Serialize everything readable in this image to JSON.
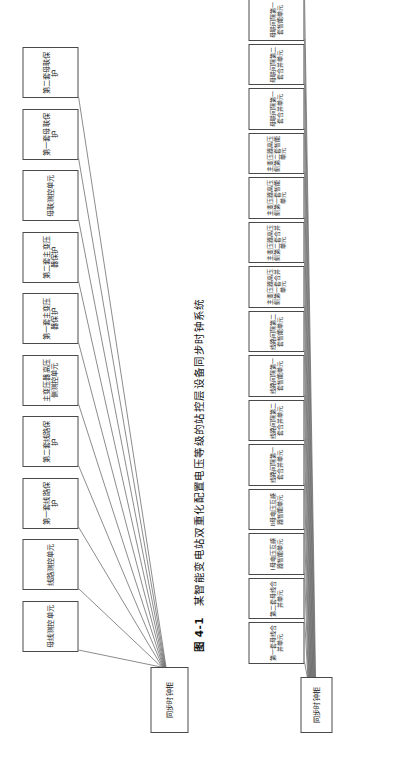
{
  "figure": {
    "caption_number": "图 4-1",
    "caption_text": "某智能变电站双重化配置电压等级的站控层设备同步时钟系统"
  },
  "diagram_top": {
    "root": {
      "label": "同步时钟柜"
    },
    "leaves": [
      {
        "label": "母线测控单元"
      },
      {
        "label": "线路测控单元"
      },
      {
        "label": "第一套线路保护"
      },
      {
        "label": "第二套线路保护"
      },
      {
        "label": "主变压器高压侧测控单元"
      },
      {
        "label": "第一套主变压器保护"
      },
      {
        "label": "第二套主变压器保护"
      },
      {
        "label": "母联测控单元"
      },
      {
        "label": "第一套母联保护"
      },
      {
        "label": "第二套母联保护"
      }
    ]
  },
  "diagram_bottom": {
    "root": {
      "label": "同步时钟柜"
    },
    "leaves": [
      {
        "label": "第一套母线合并单元"
      },
      {
        "label": "第二套母线合并单元"
      },
      {
        "label": "I母电压互感器智能单元"
      },
      {
        "label": "II母电压互感器智能单元"
      },
      {
        "label": "线路间隔第一套合并单元"
      },
      {
        "label": "线路间隔第二套合并单元"
      },
      {
        "label": "线路间隔第一套智能单元"
      },
      {
        "label": "线路间隔第二套智能单元"
      },
      {
        "label": "主变压器高压侧第一套合并单元"
      },
      {
        "label": "主变压器高压侧第二套合并单元"
      },
      {
        "label": "主变压器高压侧第一套智能单元"
      },
      {
        "label": "主变压器高压侧第二套智能单元"
      },
      {
        "label": "母联间隔第一套合并单元"
      },
      {
        "label": "母联间隔第二套合并单元"
      },
      {
        "label": "母联间隔第一套智能单元"
      },
      {
        "label": "母联间隔第二套智能单元"
      }
    ]
  },
  "style": {
    "line_color": "#5a5a5a",
    "box_border": "#4a4a4a",
    "text_color": "#1a1a1a",
    "page_background": "#ffffff"
  }
}
